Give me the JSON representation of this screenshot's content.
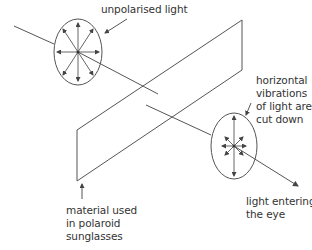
{
  "labels": {
    "unpolarised": "unpolarised light",
    "horizontal_cut": "horizontal\nvibrations\nof light are\ncut down",
    "material": "material used\nin polaroid\nsunglasses",
    "entering_eye": "light entering\nthe eye"
  },
  "colors": {
    "line": "#444444",
    "text": "#333333"
  }
}
